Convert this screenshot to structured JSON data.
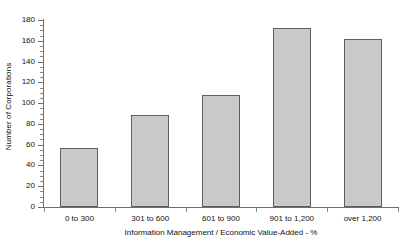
{
  "chart_data": {
    "type": "bar",
    "title": "",
    "subtitle": "",
    "categories": [
      "0 to 300",
      "301 to 600",
      "601 to 900",
      "901 to 1,200",
      "over 1,200"
    ],
    "values": [
      57,
      89,
      108,
      172,
      162
    ],
    "xlabel": "Information Management / Economic Value-Added - %",
    "ylabel": "Number of Corporations",
    "ylim": [
      0,
      180
    ],
    "ytick_step": 20,
    "yticks": [
      0,
      20,
      40,
      60,
      80,
      100,
      120,
      140,
      160,
      180
    ],
    "ytick_labels": [
      "0",
      "20",
      "40",
      "60",
      "80",
      "100",
      "120",
      "140",
      "160",
      "180"
    ],
    "minor_ytick_step": 5,
    "grid": false,
    "legend": null,
    "legend_position": "none",
    "annotations": [],
    "colors": {
      "bar_fill": "#c9c9c9",
      "bar_border": "#5f5f5f",
      "axis": "#6e6e6e",
      "text": "#101010",
      "background": "#ffffff"
    }
  }
}
